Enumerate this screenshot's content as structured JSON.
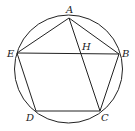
{
  "diagram": {
    "type": "geometry",
    "circle": {
      "cx": 68.5,
      "cy": 69,
      "r": 54
    },
    "points": {
      "A": {
        "x": 69,
        "y": 18,
        "label": "A"
      },
      "B": {
        "x": 119,
        "y": 54,
        "label": "B"
      },
      "C": {
        "x": 100,
        "y": 111,
        "label": "C"
      },
      "D": {
        "x": 36,
        "y": 111,
        "label": "D"
      },
      "E": {
        "x": 17,
        "y": 53,
        "label": "E"
      },
      "H": {
        "x": 81,
        "y": 53,
        "label": "H"
      }
    },
    "segments": [
      "AB",
      "BC",
      "CD",
      "DE",
      "EA",
      "AC",
      "EB"
    ],
    "labels": {
      "A": "A",
      "B": "B",
      "C": "C",
      "D": "D",
      "E": "E",
      "H": "H"
    }
  }
}
